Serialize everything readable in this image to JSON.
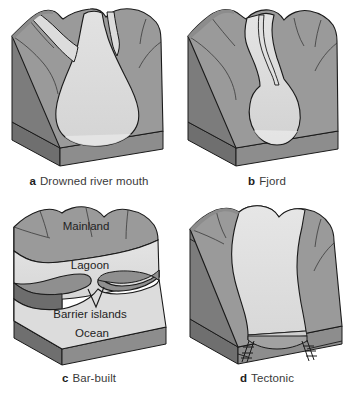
{
  "figure": {
    "background_color": "#ffffff",
    "panel_count": 4
  },
  "palette": {
    "land_top": "#9a9a9a",
    "land_top_light": "#a6a6a6",
    "land_side": "#7e7e7e",
    "land_side_dark": "#6f6f6f",
    "water": "#dcdcdc",
    "water_shadow": "#d0d0d0",
    "block_front": "#8d8d8d",
    "block_base": "#848484",
    "outline": "#1a1a1a",
    "text": "#2b2b2b"
  },
  "panels": [
    {
      "id": "a",
      "letter": "a",
      "caption": "Drowned river mouth",
      "description": "Block diagram of a drowned river mouth estuary with a wide branching funnel-shaped water body opening to the sea",
      "labels": []
    },
    {
      "id": "b",
      "letter": "b",
      "caption": "Fjord",
      "description": "Block diagram of a fjord estuary with a narrow winding channel widening into a deep basin at the sea",
      "labels": []
    },
    {
      "id": "c",
      "letter": "c",
      "caption": "Bar-built",
      "description": "Block diagram of a bar-built estuary with a shallow lagoon separated from the ocean by barrier islands",
      "labels": [
        {
          "name": "mainland",
          "text": "Mainland"
        },
        {
          "name": "lagoon",
          "text": "Lagoon"
        },
        {
          "name": "barrier-islands",
          "text": "Barrier islands"
        },
        {
          "name": "ocean",
          "text": "Ocean"
        }
      ]
    },
    {
      "id": "d",
      "letter": "d",
      "caption": "Tectonic",
      "description": "Block diagram of a tectonic estuary formed by faulting, with fault arrows on the front face of the block",
      "labels": []
    }
  ]
}
